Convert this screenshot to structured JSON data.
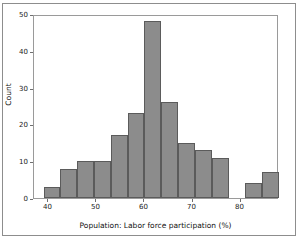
{
  "figure": {
    "background_color": "#ffffff",
    "border_color": "#8d8d8d",
    "frame_color": "#9a9a9a"
  },
  "style": {
    "bar_fill": "#8c8c8c",
    "bar_edge": "#5b5b5b",
    "text_color": "#1a1a1a"
  },
  "chart_data": {
    "type": "bar",
    "title": "",
    "subtitle": "",
    "xlabel": "Population: Labor force participation (%)",
    "ylabel": "Count",
    "grid": false,
    "legend": null,
    "legend_position": "none",
    "xlim": [
      37,
      88
    ],
    "ylim": [
      0,
      50
    ],
    "xticks": [
      40,
      50,
      60,
      70,
      80
    ],
    "xtick_labels": [
      "40",
      "50",
      "60",
      "70",
      "80"
    ],
    "yticks": [
      0,
      10,
      20,
      30,
      40,
      50
    ],
    "ytick_labels": [
      "0",
      "10",
      "20",
      "30",
      "40",
      "50"
    ],
    "bin_width": 3.5,
    "bin_edges": [
      39.0,
      42.5,
      46.0,
      49.5,
      53.0,
      56.5,
      60.0,
      63.5,
      67.0,
      70.5,
      74.0,
      77.5,
      81.0,
      84.5,
      88.0
    ],
    "bin_centers": [
      40.75,
      44.25,
      47.75,
      51.25,
      54.75,
      58.25,
      61.75,
      65.25,
      68.75,
      72.25,
      75.75,
      79.25,
      82.75,
      86.25
    ],
    "categories": [
      "39.0-42.5",
      "42.5-46.0",
      "46.0-49.5",
      "49.5-53.0",
      "53.0-56.5",
      "56.5-60.0",
      "60.0-63.5",
      "63.5-67.0",
      "67.0-70.5",
      "70.5-74.0",
      "74.0-77.5",
      "77.5-81.0",
      "81.0-84.5",
      "84.5-88.0"
    ],
    "values": [
      3,
      8,
      10,
      10,
      17,
      23,
      48,
      26,
      15,
      13,
      11,
      0,
      4,
      7
    ]
  }
}
